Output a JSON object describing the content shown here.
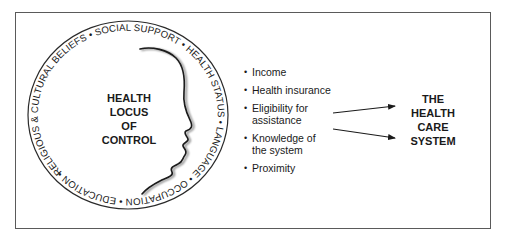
{
  "figure": {
    "ring_text": "RELIGIOUS & CULTURAL BELIEFS • SOCIAL SUPPORT • HEALTH STATUS • LANGUAGE • OCCUPATION • EDUCATION •",
    "ring_items": [
      "RELIGIOUS & CULTURAL BELIEFS",
      "SOCIAL SUPPORT",
      "HEALTH STATUS",
      "LANGUAGE",
      "OCCUPATION",
      "EDUCATION"
    ],
    "center_label": {
      "lines": [
        "HEALTH",
        "LOCUS",
        "OF",
        "CONTROL"
      ]
    },
    "factors": [
      {
        "lines": [
          "Income"
        ]
      },
      {
        "lines": [
          "Health insurance"
        ]
      },
      {
        "lines": [
          "Eligibility for",
          "assistance"
        ]
      },
      {
        "lines": [
          "Knowledge of",
          "the system"
        ]
      },
      {
        "lines": [
          "Proximity"
        ]
      }
    ],
    "bullet_glyph": "•",
    "target_label": {
      "lines": [
        "THE",
        "HEALTH",
        "CARE",
        "SYSTEM"
      ]
    },
    "colors": {
      "ink": "#1a1a1a",
      "frame": "#5a5a5a",
      "background": "#ffffff"
    }
  }
}
